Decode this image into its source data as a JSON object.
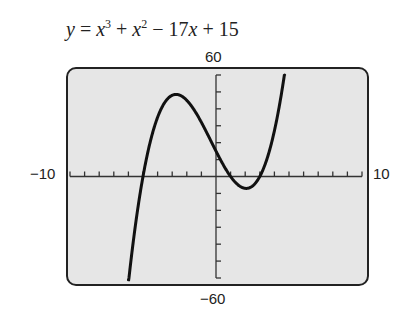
{
  "equation": {
    "y": "y",
    "eq": " = ",
    "x1": "x",
    "exp1": "3",
    "plus1": " + ",
    "x2": "x",
    "exp2": "2",
    "minus": " − 17",
    "x3": "x",
    "tail": " + 15"
  },
  "labels": {
    "ymax": "60",
    "ymin": "−60",
    "xmin": "−10",
    "xmax": "10"
  },
  "chart_data": {
    "type": "line",
    "function": "x^3 + x^2 - 17x + 15",
    "xlim": [
      -10,
      10
    ],
    "ylim": [
      -60,
      60
    ],
    "xscale": 1,
    "yscale": 10,
    "grid": false,
    "series": [
      {
        "name": "y = x^3 + x^2 - 17x + 15",
        "x": [
          -6,
          -5,
          -4,
          -3,
          -2,
          -1,
          0,
          1,
          2,
          3,
          4,
          5
        ],
        "y": [
          -63,
          0,
          35,
          48,
          45,
          32,
          15,
          0,
          -7,
          0,
          27,
          80
        ]
      }
    ],
    "roots": [
      -5,
      1,
      3
    ],
    "local_max": [
      -2.7,
      48.1
    ],
    "local_min": [
      2.1,
      -7.1
    ],
    "colors": {
      "screen": "#e6e6e6",
      "curve": "#111111",
      "frame": "#222222"
    }
  }
}
